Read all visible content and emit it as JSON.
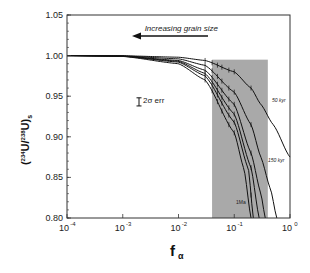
{
  "chart_data": {
    "type": "line",
    "title": "",
    "xlabel": "f_α",
    "xlabel_main": "f",
    "xlabel_sub": "α",
    "ylabel": "(234U/238U)s",
    "ylabel_parts": {
      "open": "(",
      "sup1": "234",
      "mid": "U/",
      "sup2": "238",
      "close": "U)",
      "sub": "s"
    },
    "xscale": "log",
    "xlim": [
      0.0001,
      1
    ],
    "ylim": [
      0.8,
      1.05
    ],
    "x_ticks": [
      {
        "base": "10",
        "exp": "-4",
        "value": 0.0001
      },
      {
        "base": "10",
        "exp": "-3",
        "value": 0.001
      },
      {
        "base": "10",
        "exp": "-2",
        "value": 0.01
      },
      {
        "base": "10",
        "exp": "-1",
        "value": 0.1
      },
      {
        "base": "10",
        "exp": "0",
        "value": 1
      }
    ],
    "y_ticks": [
      "0.80",
      "0.85",
      "0.90",
      "0.95",
      "1.00",
      "1.05"
    ],
    "grid": false,
    "legend": null,
    "shaded_region": {
      "x_range": [
        0.04,
        0.4
      ],
      "y_range": [
        0.8,
        0.995
      ],
      "color": "#a9a9a9"
    },
    "annotations": {
      "arrow_label": "Increasing grain size",
      "error_bar_label": "2σ err",
      "curve_label_top": "50 kyr",
      "curve_label_mid": "150 kyr",
      "curve_label_bottom": "1Ma"
    },
    "series": [
      {
        "name": "50 kyr",
        "points": [
          [
            0.0001,
            1.0
          ],
          [
            0.001,
            0.9998
          ],
          [
            0.01,
            0.998
          ],
          [
            0.03,
            0.994
          ],
          [
            0.1,
            0.98
          ],
          [
            0.2,
            0.96
          ],
          [
            0.3,
            0.94
          ],
          [
            0.5,
            0.915
          ],
          [
            1.0,
            0.875
          ]
        ]
      },
      {
        "name": "150 kyr",
        "points": [
          [
            0.0001,
            1.0
          ],
          [
            0.001,
            0.9996
          ],
          [
            0.01,
            0.996
          ],
          [
            0.03,
            0.988
          ],
          [
            0.1,
            0.955
          ],
          [
            0.2,
            0.915
          ],
          [
            0.3,
            0.875
          ],
          [
            0.45,
            0.835
          ],
          [
            0.58,
            0.8
          ]
        ]
      },
      {
        "name": "curve-3",
        "points": [
          [
            0.0001,
            1.0
          ],
          [
            0.001,
            0.9994
          ],
          [
            0.01,
            0.994
          ],
          [
            0.03,
            0.982
          ],
          [
            0.1,
            0.94
          ],
          [
            0.2,
            0.88
          ],
          [
            0.3,
            0.83
          ],
          [
            0.36,
            0.8
          ]
        ]
      },
      {
        "name": "curve-4",
        "points": [
          [
            0.0001,
            1.0
          ],
          [
            0.001,
            0.9993
          ],
          [
            0.01,
            0.993
          ],
          [
            0.03,
            0.978
          ],
          [
            0.1,
            0.928
          ],
          [
            0.2,
            0.862
          ],
          [
            0.28,
            0.8
          ]
        ]
      },
      {
        "name": "curve-5",
        "points": [
          [
            0.0001,
            1.0
          ],
          [
            0.001,
            0.9992
          ],
          [
            0.01,
            0.992
          ],
          [
            0.03,
            0.975
          ],
          [
            0.1,
            0.918
          ],
          [
            0.18,
            0.86
          ],
          [
            0.22,
            0.8
          ]
        ]
      },
      {
        "name": "1Ma",
        "points": [
          [
            0.0001,
            1.0
          ],
          [
            0.001,
            0.999
          ],
          [
            0.01,
            0.99
          ],
          [
            0.03,
            0.97
          ],
          [
            0.1,
            0.905
          ],
          [
            0.15,
            0.86
          ],
          [
            0.2,
            0.8
          ]
        ]
      }
    ],
    "error_bar": {
      "x": 0.0022,
      "y_center": 0.943,
      "half_height": 0.005
    }
  }
}
